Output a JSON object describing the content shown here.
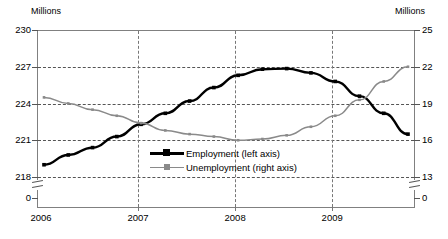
{
  "axes": {
    "left_unit_label": "Millions",
    "right_unit_label": "Millions",
    "left_ticks": [
      "230",
      "227",
      "224",
      "221",
      "218",
      "0"
    ],
    "right_ticks": [
      "25",
      "22",
      "19",
      "16",
      "13",
      "0"
    ],
    "x_ticks": [
      "2006",
      "2007",
      "2008",
      "2009"
    ]
  },
  "legend": {
    "items": [
      {
        "label": "Employment (left axis)",
        "color": "#000000"
      },
      {
        "label": "Unemployment (right axis)",
        "color": "#8a8a8a"
      }
    ]
  },
  "chart_data": {
    "type": "line",
    "title": "",
    "subtitle": "",
    "xlabel": "",
    "ylabel": "Millions",
    "y2label": "Millions",
    "grid": true,
    "legend_position": "inside-bottom-center",
    "axis_break": true,
    "x": [
      "2006Q1",
      "2006Q2",
      "2006Q3",
      "2006Q4",
      "2007Q1",
      "2007Q2",
      "2007Q3",
      "2007Q4",
      "2008Q1",
      "2008Q2",
      "2008Q3",
      "2008Q4",
      "2009Q1",
      "2009Q2",
      "2009Q3",
      "2009Q4"
    ],
    "xlim": [
      "2006Q1",
      "2009Q4"
    ],
    "ylim": [
      218,
      230
    ],
    "y2lim": [
      13,
      25
    ],
    "yticks": [
      218,
      221,
      224,
      227,
      230
    ],
    "y2ticks": [
      13,
      16,
      19,
      22,
      25
    ],
    "series": [
      {
        "name": "Employment (left axis)",
        "axis": "left",
        "color": "#000000",
        "units": "Millions",
        "values": [
          219.0,
          219.8,
          220.4,
          221.3,
          222.3,
          223.2,
          224.2,
          225.3,
          226.3,
          226.8,
          226.85,
          226.5,
          225.8,
          224.6,
          223.2,
          221.5
        ]
      },
      {
        "name": "Unemployment (right axis)",
        "axis": "right",
        "color": "#8a8a8a",
        "units": "Millions",
        "values": [
          19.5,
          19.0,
          18.5,
          18.0,
          17.4,
          16.8,
          16.5,
          16.3,
          16.0,
          16.1,
          16.4,
          17.1,
          18.0,
          19.3,
          20.8,
          22.0
        ]
      }
    ]
  }
}
